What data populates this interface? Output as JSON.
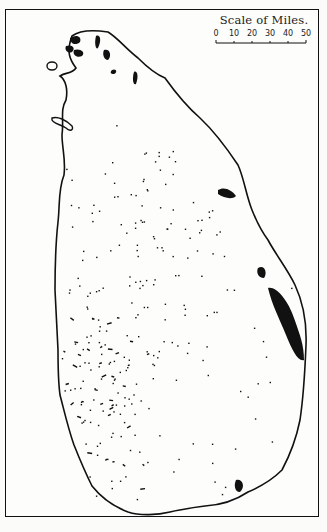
{
  "map": {
    "subject": "Island map with stippled distribution",
    "scale": {
      "title": "Scale of Miles.",
      "ticks": [
        "0",
        "10",
        "20",
        "30",
        "40",
        "50"
      ],
      "unit": "miles"
    },
    "colors": {
      "ink": "#111111",
      "paper": "#fdfdfc",
      "background": "#fbfbfa"
    }
  }
}
